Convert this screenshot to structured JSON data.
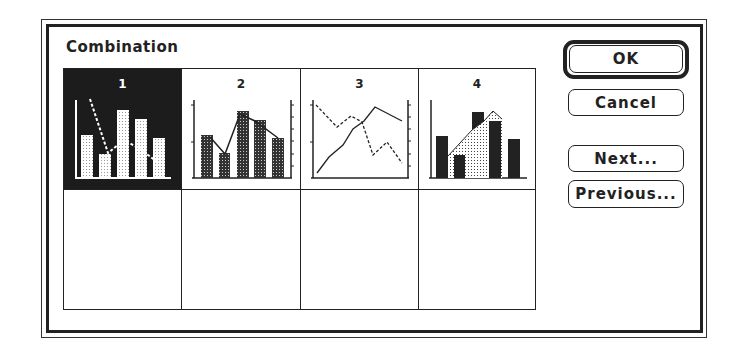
{
  "dialog": {
    "title": "Combination"
  },
  "gallery": {
    "selected_index": 0,
    "cells": [
      {
        "label": "1",
        "kind": "bar-with-line",
        "selected": true
      },
      {
        "label": "2",
        "kind": "bar-with-line-dual-axis",
        "selected": false
      },
      {
        "label": "3",
        "kind": "two-lines-dual-axis",
        "selected": false
      },
      {
        "label": "4",
        "kind": "area-with-columns",
        "selected": false
      },
      {
        "label": "",
        "kind": "empty",
        "selected": false
      },
      {
        "label": "",
        "kind": "empty",
        "selected": false
      },
      {
        "label": "",
        "kind": "empty",
        "selected": false
      },
      {
        "label": "",
        "kind": "empty",
        "selected": false
      }
    ]
  },
  "buttons": {
    "ok": "OK",
    "cancel": "Cancel",
    "next": "Next...",
    "previous": "Previous..."
  },
  "colors": {
    "ink": "#222222",
    "selected_cell_bg": "#1c1c1c",
    "background": "#ffffff"
  }
}
